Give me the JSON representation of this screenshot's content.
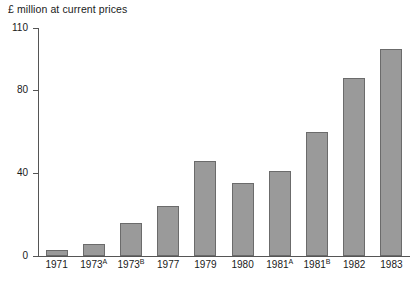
{
  "chart_data": {
    "type": "bar",
    "title": "£ million at current prices",
    "xlabel": "",
    "ylabel": "",
    "ylim": [
      0,
      110
    ],
    "yticks": [
      0,
      40,
      80,
      110
    ],
    "ytick_labels": [
      "0",
      "40",
      "80",
      "110"
    ],
    "grid": false,
    "legend": null,
    "categories": [
      "1971",
      "1973",
      "1973",
      "1977",
      "1979",
      "1980",
      "1981",
      "1981",
      "1982",
      "1983"
    ],
    "category_superscripts": [
      "",
      "A",
      "B",
      "",
      "",
      "",
      "A",
      "B",
      "",
      ""
    ],
    "category_labels": [
      "1971",
      "1973A",
      "1973B",
      "1977",
      "1979",
      "1980",
      "1981A",
      "1981B",
      "1982",
      "1983"
    ],
    "values": [
      3,
      6,
      16,
      24,
      46,
      35,
      41,
      60,
      86,
      100
    ],
    "bar_color": "#9a9a9a",
    "bar_border_color": "#6b6b6b",
    "axis_color": "#555555"
  },
  "colors": {
    "background": "#ffffff",
    "text": "#1a1a1a",
    "bar_fill": "#9a9a9a",
    "bar_stroke": "#6b6b6b",
    "axis": "#555555"
  }
}
